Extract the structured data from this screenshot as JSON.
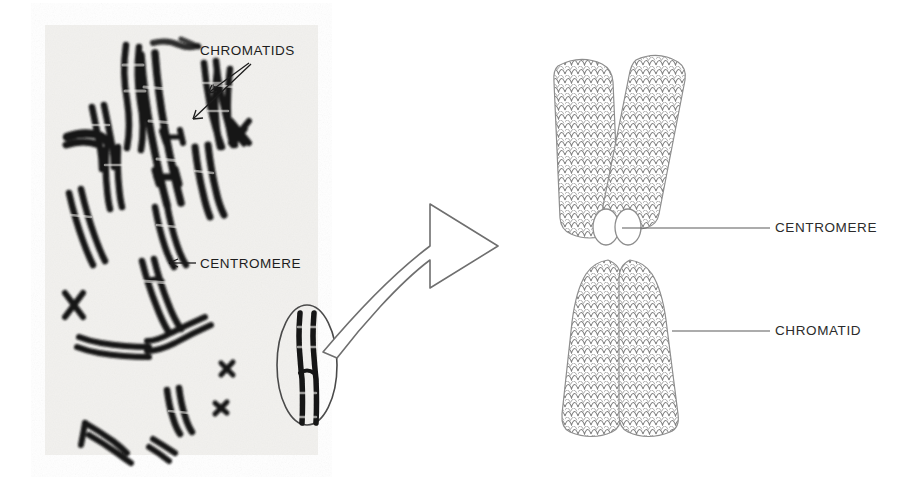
{
  "figure": {
    "background_color": "#ffffff"
  },
  "micrograph": {
    "name": "chromosome-spread-micrograph",
    "background_color": "#f2f1ee",
    "chromosome_color": "#111111",
    "labels": [
      {
        "id": "chromatids",
        "text": "CHROMATIDS",
        "x": 200,
        "y": 55,
        "font_size": 13,
        "arrow_count": 2,
        "arrow_targets": [
          {
            "x": 205,
            "y": 92
          },
          {
            "x": 192,
            "y": 118
          }
        ],
        "arrow_origin": {
          "x": 249,
          "y": 63
        }
      },
      {
        "id": "centromere",
        "text": "CENTROMERE",
        "x": 200,
        "y": 268,
        "font_size": 13,
        "arrow_count": 1,
        "arrow_targets": [
          {
            "x": 170,
            "y": 263
          }
        ],
        "arrow_origin": {
          "x": 196,
          "y": 263
        }
      }
    ],
    "highlight_ellipse": {
      "name": "selected-chromosome-ellipse",
      "cx": 307,
      "cy": 365,
      "rx": 30,
      "ry": 60,
      "stroke": "#4a4a4a"
    }
  },
  "connector": {
    "name": "magnification-arrow",
    "description": "curved outlined arrow pointing from circled chromosome to schematic",
    "stroke": "#6b6b6b",
    "fill": "#ffffff"
  },
  "diagram": {
    "name": "chromosome-schematic",
    "stroke": "#8a8a8a",
    "coil_color": "#7d7d7d",
    "labels": [
      {
        "id": "centromere",
        "text": "CENTROMERE",
        "text_x": 775,
        "text_y": 233,
        "font_size": 13,
        "leader_from": {
          "x": 630,
          "y": 228
        },
        "leader_to": {
          "x": 768,
          "y": 228
        }
      },
      {
        "id": "chromatid",
        "text": "CHROMATID",
        "text_x": 775,
        "text_y": 338,
        "font_size": 13,
        "leader_from": {
          "x": 672,
          "y": 331
        },
        "leader_to": {
          "x": 768,
          "y": 331
        }
      }
    ],
    "centromere": {
      "name": "centromere-constriction",
      "lobe_left": {
        "cx": 604,
        "cy": 222,
        "rx": 12,
        "ry": 17
      },
      "lobe_right": {
        "cx": 625,
        "cy": 222,
        "rx": 12,
        "ry": 17
      }
    }
  }
}
